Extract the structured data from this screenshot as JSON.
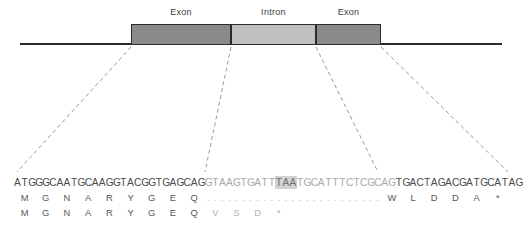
{
  "figure": {
    "title": "",
    "diagram": {
      "features": [
        {
          "name": "exon-1",
          "label": "Exon",
          "type": "exon",
          "left": 131,
          "width": 100,
          "color": "#8a8a8a"
        },
        {
          "name": "intron-1",
          "label": "Intron",
          "type": "intron",
          "left": 231,
          "width": 85,
          "color": "#c0c0c0"
        },
        {
          "name": "exon-2",
          "label": "Exon",
          "type": "exon",
          "left": 316,
          "width": 65,
          "color": "#8a8a8a"
        }
      ],
      "axis_color": "#2b2b2b",
      "border_color": "#2b2b2b"
    },
    "connectors": {
      "color": "#8f8f8f",
      "dash": "4,3",
      "lines": [
        {
          "name": "exon1-start",
          "x1": 131,
          "y1": 47,
          "x2": 17,
          "y2": 172
        },
        {
          "name": "exon1-end",
          "x1": 231,
          "y1": 47,
          "x2": 205,
          "y2": 172
        },
        {
          "name": "intron-end",
          "x1": 316,
          "y1": 47,
          "x2": 378,
          "y2": 172
        },
        {
          "name": "exon2-end",
          "x1": 381,
          "y1": 47,
          "x2": 508,
          "y2": 172
        }
      ]
    },
    "sequence": {
      "dna_label": "genomic-dna-sequence",
      "segments": [
        {
          "name": "exon1-dna",
          "class": "exon",
          "text": "ATGGGCAATGCAAGGTACGGTGAGCAG"
        },
        {
          "name": "intron-5prime",
          "class": "intron",
          "text": "GTAAGTGATT"
        },
        {
          "name": "intron-stop",
          "class": "stop",
          "text": "TAA"
        },
        {
          "name": "intron-3prime",
          "class": "intron",
          "text": "TGCATTTCTCGCAG"
        },
        {
          "name": "exon2-dna",
          "class": "exon",
          "text": "TGACTAGACGATGCATAG"
        }
      ],
      "full_dna": "ATGGGCAATGCAAGGTACGGTGAGCAGGTAAGTGATTAATGCATTTCTCGCAGTGACTAGACGATGCATAG",
      "stop_codon_in_intron": "TAA",
      "protein_spliced": {
        "name": "spliced-protein-row",
        "residues": [
          "M",
          "G",
          "N",
          "A",
          "R",
          "Y",
          "G",
          "E",
          "Q"
        ],
        "gap_char": ".",
        "gap_count": 25,
        "tail_residues": [
          "W",
          "L",
          "D",
          "D",
          "A",
          "*"
        ]
      },
      "protein_intron_retained": {
        "name": "intron-retained-protein-row",
        "residues": [
          "M",
          "G",
          "N",
          "A",
          "R",
          "Y",
          "G",
          "E",
          "Q"
        ],
        "altered_residues": [
          "V",
          "S",
          "D",
          "*"
        ]
      }
    },
    "colors": {
      "exon_fill": "#8a8a8a",
      "intron_fill": "#c0c0c0",
      "outline": "#2b2b2b",
      "dna_exon_text": "#4a4a4a",
      "dna_intron_text": "#a8a8a8",
      "stop_highlight": "#d2d2d2",
      "dash_line": "#8f8f8f",
      "background": "#ffffff"
    }
  }
}
